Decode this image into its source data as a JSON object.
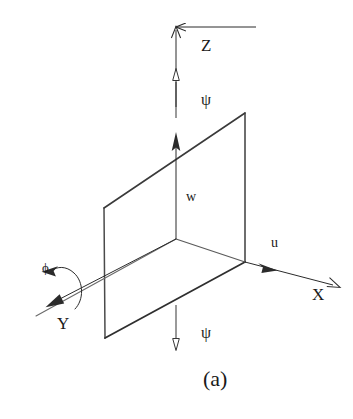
{
  "figure": {
    "caption": "(a)",
    "stroke_color": "#2b2b2b",
    "plane_edge_color": "#3a3a3a",
    "background_color": "#ffffff",
    "width": 353,
    "height": 419
  },
  "axes": [
    {
      "id": "z-axis",
      "label": "Z",
      "label_x": 201,
      "label_y": 37,
      "direction": "up",
      "description": "vertical axis pointing up"
    },
    {
      "id": "x-axis",
      "label": "X",
      "label_x": 312,
      "label_y": 286,
      "direction": "right-down",
      "description": "axis pointing right and slightly down"
    },
    {
      "id": "y-axis",
      "label": "Y",
      "label_x": 57,
      "label_y": 315,
      "direction": "left-down",
      "description": "axis pointing left and down"
    }
  ],
  "velocities": [
    {
      "id": "w-velocity",
      "label": "w",
      "label_x": 186,
      "label_y": 190,
      "description": "vertical velocity component along Z"
    },
    {
      "id": "u-velocity",
      "label": "u",
      "label_x": 271,
      "label_y": 236,
      "description": "longitudinal velocity component along X"
    }
  ],
  "angles": [
    {
      "id": "psi-upper",
      "label": "ψ",
      "label_x": 201,
      "label_y": 92,
      "description": "yaw angle indicator above origin"
    },
    {
      "id": "psi-lower",
      "label": "ψ",
      "label_x": 201,
      "label_y": 325,
      "description": "yaw angle indicator below origin"
    },
    {
      "id": "phi-roll",
      "label": "ϕ",
      "label_x": 42,
      "label_y": 261,
      "description": "roll angle about the Y axis"
    }
  ],
  "planes": [
    {
      "id": "vertical-plane",
      "points": "104,208 245,113 245,262 105,338",
      "description": "vertical parallelogram plane containing Z and X directions"
    },
    {
      "id": "horizontal-plane",
      "points": "105,338 245,262 176,239 35,316",
      "description": "horizontal parallelogram plane containing X and Y directions"
    }
  ]
}
